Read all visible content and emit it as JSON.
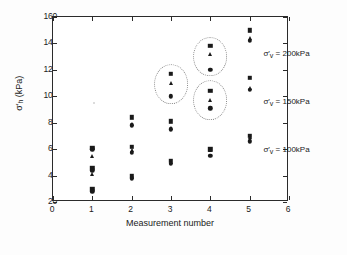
{
  "chart_data": {
    "type": "scatter",
    "title": "",
    "xlabel": "Measurement number",
    "ylabel": "σ'h (kPa)",
    "ylabel_symbol": "σ",
    "ylabel_sub": "h",
    "ylabel_units": "(kPa)",
    "xlim": [
      0,
      6
    ],
    "ylim": [
      20,
      160
    ],
    "xticks": [
      0,
      1,
      2,
      3,
      4,
      5,
      6
    ],
    "yticks": [
      20,
      40,
      60,
      80,
      100,
      120,
      140,
      160
    ],
    "grid": false,
    "legend": "none",
    "x": [
      1,
      2,
      3,
      4,
      5
    ],
    "series": [
      {
        "name": "σ'v = 100kPa, square",
        "marker": "square",
        "values": [
          30,
          40,
          51,
          60,
          70
        ]
      },
      {
        "name": "σ'v = 100kPa, triangle",
        "marker": "triangle",
        "values": [
          29,
          39,
          50,
          59,
          69
        ]
      },
      {
        "name": "σ'v = 100kPa, circle",
        "marker": "circle",
        "values": [
          28,
          38,
          49,
          55,
          66
        ]
      },
      {
        "name": "σ'v = 150kPa, square",
        "marker": "square",
        "values": [
          46,
          62,
          81,
          104,
          114
        ]
      },
      {
        "name": "σ'v = 150kPa, triangle",
        "marker": "triangle",
        "values": [
          41,
          59,
          76,
          97,
          106
        ]
      },
      {
        "name": "σ'v = 150kPa, circle",
        "marker": "circle",
        "values": [
          44,
          57,
          75,
          91,
          105
        ]
      },
      {
        "name": "σ'v = 200kPa, square",
        "marker": "square",
        "values": [
          61,
          84,
          117,
          138,
          150
        ]
      },
      {
        "name": "σ'v = 200kPa, triangle",
        "marker": "triangle",
        "values": [
          55,
          79,
          110,
          132,
          144
        ]
      },
      {
        "name": "σ'v = 200kPa, circle",
        "marker": "circle",
        "values": [
          60,
          78,
          100,
          120,
          142
        ]
      }
    ],
    "annotations": [
      {
        "text": "σ'v = 200kPa",
        "symbol": "σ",
        "sub": "v",
        "rest": " = 200kPa",
        "x": 5.35,
        "y": 132
      },
      {
        "text": "σ'v = 150kPa",
        "symbol": "σ",
        "sub": "v",
        "rest": " = 150kPa",
        "x": 5.35,
        "y": 96
      },
      {
        "text": "σ'v = 100kPa",
        "symbol": "σ",
        "sub": "v",
        "rest": " = 100kPa",
        "x": 5.35,
        "y": 59
      }
    ],
    "highlight_circles": [
      {
        "label": "cluster-x3-200kPa",
        "cx": 3.0,
        "cy": 109,
        "rx": 0.43,
        "ry": 15
      },
      {
        "label": "cluster-x4-200kPa",
        "cx": 4.0,
        "cy": 130,
        "rx": 0.43,
        "ry": 15
      },
      {
        "label": "cluster-x4-150kPa",
        "cx": 4.0,
        "cy": 97,
        "rx": 0.43,
        "ry": 15
      }
    ]
  },
  "axis": {
    "x_title": "Measurement number",
    "x_tick_labels": [
      "0",
      "1",
      "2",
      "3",
      "4",
      "5",
      "6"
    ],
    "y_tick_labels": [
      "20",
      "40",
      "60",
      "80",
      "100",
      "120",
      "140",
      "160"
    ],
    "y_unit": "(kPa)"
  }
}
